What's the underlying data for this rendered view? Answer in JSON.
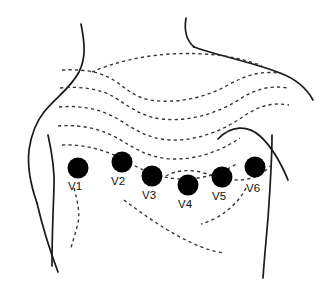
{
  "figure": {
    "background_color": "#ffffff",
    "outline_color": "#1a1a1a",
    "rib_line_color": "#333333",
    "electrode_color": "#000000",
    "label_color": "#111111",
    "width": 322,
    "height": 293
  },
  "electrodes": [
    {
      "id": "V1",
      "label": "V1",
      "cx": 78,
      "cy": 168,
      "r": 10.5,
      "label_x": 68,
      "label_y": 181
    },
    {
      "id": "V2",
      "label": "V2",
      "cx": 122,
      "cy": 162,
      "r": 10.5,
      "label_x": 111,
      "label_y": 176
    },
    {
      "id": "V3",
      "label": "V3",
      "cx": 152,
      "cy": 176,
      "r": 10.5,
      "label_x": 142,
      "label_y": 190
    },
    {
      "id": "V4",
      "label": "V4",
      "cx": 188,
      "cy": 185,
      "r": 10.5,
      "label_x": 178,
      "label_y": 199
    },
    {
      "id": "V5",
      "label": "V5",
      "cx": 222,
      "cy": 177,
      "r": 10.5,
      "label_x": 212,
      "label_y": 191
    },
    {
      "id": "V6",
      "label": "V6",
      "cx": 255,
      "cy": 167,
      "r": 10.5,
      "label_x": 246,
      "label_y": 183
    }
  ],
  "anatomy": {
    "body_outline_parts": [
      "neck-left",
      "neck-right",
      "shoulder-left",
      "shoulder-right",
      "arm-left",
      "torso-side-left",
      "torso-side-right",
      "breast-contour-right"
    ],
    "rib_lines_count": 9
  }
}
